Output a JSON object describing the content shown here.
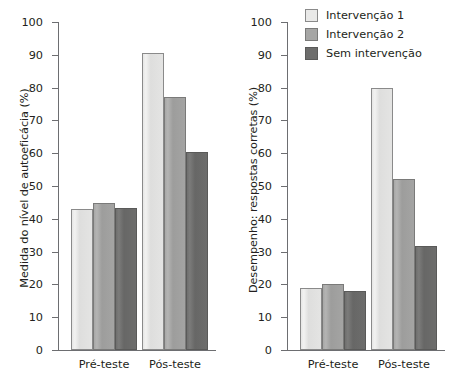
{
  "chart_data": [
    {
      "panel": "left",
      "type": "bar",
      "title": "",
      "xlabel": "",
      "ylabel": "Medida do nível de autoeficácia (%)",
      "categories": [
        "Pré-teste",
        "Pós-teste"
      ],
      "series": [
        {
          "name": "Intervenção 1",
          "values": [
            43.0,
            90.7
          ],
          "color": "#e9e9e8"
        },
        {
          "name": "Intervenção 2",
          "values": [
            44.7,
            77.0
          ],
          "color": "#a6a6a5"
        },
        {
          "name": "Sem intervenção",
          "values": [
            43.4,
            60.5
          ],
          "color": "#6d6d6c"
        }
      ],
      "ylim": [
        0,
        100
      ],
      "yticks": [
        0,
        10,
        20,
        30,
        40,
        50,
        60,
        70,
        80,
        90,
        100
      ],
      "ytick_labels": [
        "0",
        "10",
        "20",
        "30",
        "40",
        "50",
        "60",
        "70",
        "80",
        "90",
        "100"
      ],
      "grid": false,
      "legend": false
    },
    {
      "panel": "right",
      "type": "bar",
      "title": "",
      "xlabel": "",
      "ylabel": "Desempenho: respostas corretas (%)",
      "categories": [
        "Pré-teste",
        "Pós-teste"
      ],
      "series": [
        {
          "name": "Intervenção 1",
          "values": [
            19.0,
            79.9
          ],
          "color": "#e9e9e8"
        },
        {
          "name": "Intervenção 2",
          "values": [
            20.2,
            52.0
          ],
          "color": "#a6a6a5"
        },
        {
          "name": "Sem intervenção",
          "values": [
            18.1,
            31.8
          ],
          "color": "#6d6d6c"
        }
      ],
      "ylim": [
        0,
        100
      ],
      "yticks": [
        0,
        10,
        20,
        30,
        40,
        50,
        60,
        70,
        80,
        90,
        100
      ],
      "ytick_labels": [
        "0",
        "10",
        "20",
        "30",
        "40",
        "50",
        "60",
        "70",
        "80",
        "90",
        "100"
      ],
      "grid": false,
      "legend": true,
      "legend_position": "top-right",
      "legend_entries": [
        "Intervenção 1",
        "Intervenção 2",
        "Sem intervenção"
      ]
    }
  ]
}
